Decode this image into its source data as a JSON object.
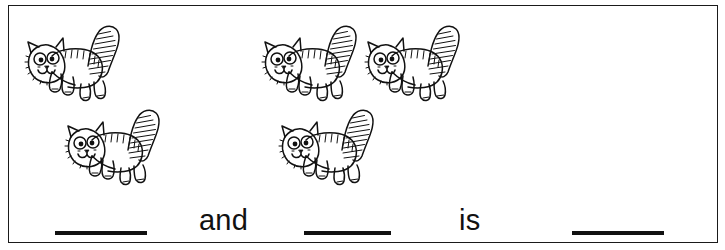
{
  "worksheet": {
    "title": "Addition picture worksheet with kittens",
    "frame_color": "#1a1a1a",
    "ink_color": "#111111",
    "background_color": "#ffffff"
  },
  "picture": {
    "icon_name": "kitten-icon",
    "groups": [
      {
        "name": "left-group",
        "count": 2,
        "count_label": "2",
        "cats": [
          {
            "name": "kitten-left-1"
          },
          {
            "name": "kitten-left-2"
          }
        ]
      },
      {
        "name": "right-group",
        "count": 3,
        "count_label": "3",
        "cats": [
          {
            "name": "kitten-right-1"
          },
          {
            "name": "kitten-right-2"
          },
          {
            "name": "kitten-right-3"
          }
        ]
      }
    ]
  },
  "sentence": {
    "blank_1": "",
    "word_and": "and",
    "blank_2": "",
    "word_is": "is",
    "blank_3": ""
  }
}
